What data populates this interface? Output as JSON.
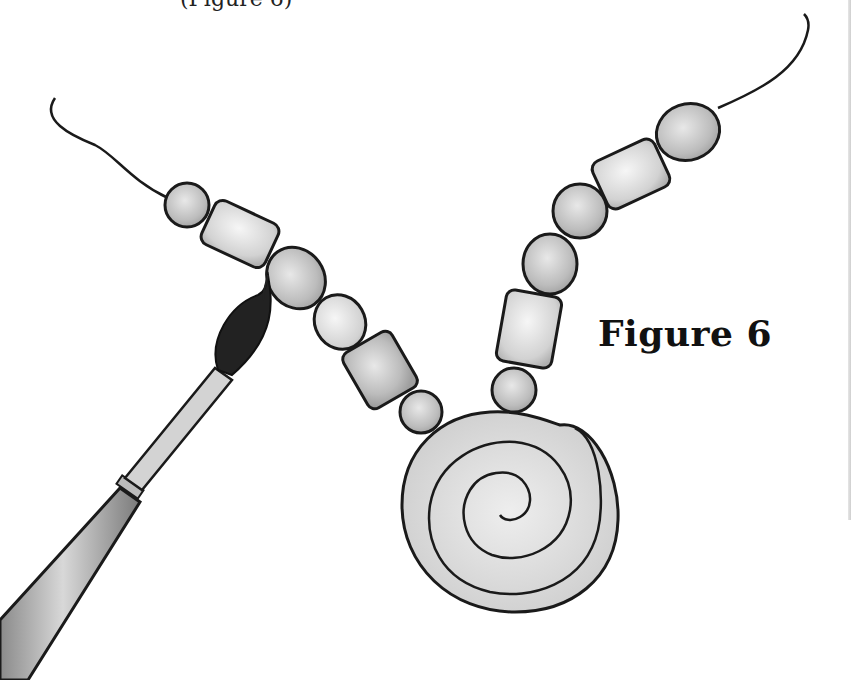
{
  "illustration": {
    "caption": "Figure 6",
    "top_cut_text": "(Figure 6)",
    "subject": "Beaded necklace with spiral pendant being painted with a brush",
    "colors": {
      "background": "#ffffff",
      "outline": "#1a1a1a",
      "bead_gray": "#bdbdbd",
      "bead_light": "#dcdcdc",
      "brush_bristles": "#222222",
      "ferrule": "#c9c9c9",
      "handle": "#a9a9a9"
    },
    "elements": {
      "left_beads": [
        "round",
        "tube",
        "oval",
        "oval",
        "tube",
        "round"
      ],
      "right_beads": [
        "round",
        "tube",
        "oval",
        "round",
        "oval",
        "tube",
        "oval"
      ],
      "pendant": "spiral coil",
      "tool": "round paintbrush"
    }
  }
}
